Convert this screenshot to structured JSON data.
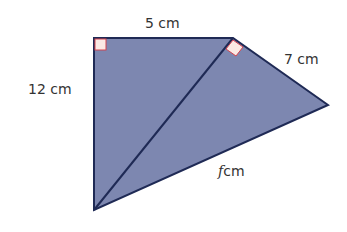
{
  "diagram": {
    "colors": {
      "fill": "#7d87b0",
      "stroke": "#1f2a55",
      "right_angle_fill": "#fbe9e4",
      "right_angle_stroke": "#d2434f",
      "text": "#333333"
    },
    "vertices": {
      "A": [
        94,
        38
      ],
      "B": [
        233,
        38
      ],
      "C": [
        328,
        105
      ],
      "D": [
        94,
        210
      ]
    },
    "labels": {
      "top": "5 cm",
      "left": "12 cm",
      "right": "7 cm",
      "bottom_var": "f",
      "bottom_unit": "cm"
    },
    "right_angles": [
      "A",
      "B"
    ]
  }
}
